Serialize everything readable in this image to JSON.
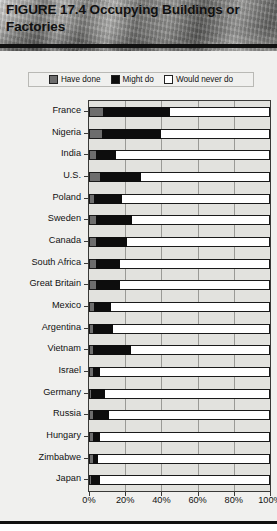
{
  "figure": {
    "title": "FIGURE 17.4 Occupying Buildings or Factories"
  },
  "legend": {
    "items": [
      {
        "label": "Have done",
        "color": "#6d6d6d",
        "key": "have_done"
      },
      {
        "label": "Might do",
        "color": "#0d0d0d",
        "key": "might_do"
      },
      {
        "label": "Would never do",
        "color": "#ffffff",
        "key": "would_never_do"
      }
    ]
  },
  "axis": {
    "x_ticks": [
      "0%",
      "20%",
      "40%",
      "60%",
      "80%",
      "100%"
    ],
    "x_tick_values": [
      0,
      20,
      40,
      60,
      80,
      100
    ]
  },
  "chart_data": {
    "type": "bar",
    "orientation": "horizontal",
    "stacked": true,
    "percent": true,
    "title": "FIGURE 17.4 Occupying Buildings or Factories",
    "xlabel": "",
    "ylabel": "",
    "xlim": [
      0,
      100
    ],
    "grid": true,
    "legend_position": "top",
    "categories": [
      "France",
      "Nigeria",
      "India",
      "U.S.",
      "Poland",
      "Sweden",
      "Canada",
      "South Africa",
      "Great Britain",
      "Mexico",
      "Argentina",
      "Vietnam",
      "Israel",
      "Germany",
      "Russia",
      "Hungary",
      "Zimbabwe",
      "Japan"
    ],
    "series": [
      {
        "name": "Have done",
        "color": "#6d6d6d",
        "values": [
          8,
          7,
          4,
          6,
          3,
          4,
          4,
          4,
          4,
          3,
          2,
          2,
          2,
          1,
          2,
          2,
          2,
          1
        ]
      },
      {
        "name": "Might do",
        "color": "#0d0d0d",
        "values": [
          37,
          33,
          11,
          23,
          15,
          20,
          17,
          13,
          13,
          9,
          11,
          21,
          4,
          8,
          9,
          4,
          3,
          5
        ]
      },
      {
        "name": "Would never do",
        "color": "#ffffff",
        "values": [
          55,
          60,
          85,
          71,
          82,
          76,
          79,
          83,
          83,
          88,
          87,
          77,
          94,
          91,
          89,
          94,
          95,
          94
        ]
      }
    ]
  }
}
